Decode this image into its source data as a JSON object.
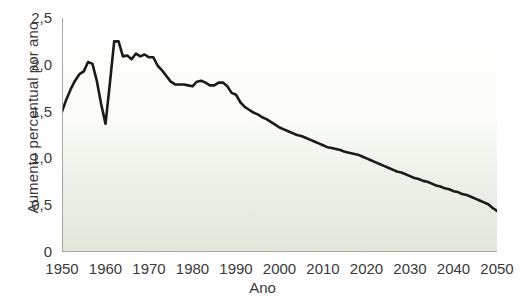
{
  "chart_data": {
    "type": "line",
    "title": "",
    "xlabel": "Ano",
    "ylabel": "Aumento percentual por ano",
    "xlim": [
      1950,
      2050
    ],
    "ylim": [
      0,
      2.5
    ],
    "grid": false,
    "legend": "none",
    "line_color": "#1a1a1a",
    "background_top_color": "#ffffff",
    "background_bottom_color": "#e1e6db",
    "axis_color": "#8f968c",
    "text_color": "#3a3a3a",
    "xticks": [
      1950,
      1960,
      1970,
      1980,
      1990,
      2000,
      2010,
      2020,
      2030,
      2040,
      2050
    ],
    "xtick_labels": [
      "1950",
      "1960",
      "1970",
      "1980",
      "1990",
      "2000",
      "2010",
      "2020",
      "2030",
      "2040",
      "2050"
    ],
    "yticks": [
      0,
      0.5,
      1.0,
      1.5,
      2.0,
      2.5
    ],
    "ytick_labels": [
      "0",
      "0,5",
      "1,0",
      "1,5",
      "2,0",
      "2,5"
    ],
    "series": [
      {
        "name": "Aumento percentual por ano",
        "x": [
          1950,
          1951,
          1952,
          1953,
          1954,
          1955,
          1956,
          1957,
          1958,
          1959,
          1960,
          1961,
          1962,
          1963,
          1964,
          1965,
          1966,
          1967,
          1968,
          1969,
          1970,
          1971,
          1972,
          1973,
          1974,
          1975,
          1976,
          1977,
          1978,
          1979,
          1980,
          1981,
          1982,
          1983,
          1984,
          1985,
          1986,
          1987,
          1988,
          1989,
          1990,
          1991,
          1992,
          1993,
          1994,
          1995,
          1996,
          1997,
          1998,
          1999,
          2000,
          2001,
          2002,
          2003,
          2004,
          2005,
          2006,
          2007,
          2008,
          2009,
          2010,
          2011,
          2012,
          2013,
          2014,
          2015,
          2016,
          2017,
          2018,
          2019,
          2020,
          2021,
          2022,
          2023,
          2024,
          2025,
          2026,
          2027,
          2028,
          2029,
          2030,
          2031,
          2032,
          2033,
          2034,
          2035,
          2036,
          2037,
          2038,
          2039,
          2040,
          2041,
          2042,
          2043,
          2044,
          2045,
          2046,
          2047,
          2048,
          2049,
          2050
        ],
        "y": [
          1.5,
          1.63,
          1.74,
          1.83,
          1.9,
          1.93,
          2.03,
          2.01,
          1.83,
          1.58,
          1.37,
          1.8,
          2.25,
          2.25,
          2.09,
          2.1,
          2.06,
          2.12,
          2.09,
          2.11,
          2.08,
          2.08,
          1.99,
          1.94,
          1.88,
          1.82,
          1.79,
          1.79,
          1.79,
          1.78,
          1.77,
          1.82,
          1.83,
          1.81,
          1.78,
          1.78,
          1.81,
          1.81,
          1.77,
          1.7,
          1.68,
          1.6,
          1.55,
          1.52,
          1.49,
          1.47,
          1.44,
          1.42,
          1.39,
          1.36,
          1.33,
          1.31,
          1.29,
          1.27,
          1.25,
          1.24,
          1.22,
          1.2,
          1.18,
          1.16,
          1.14,
          1.12,
          1.11,
          1.1,
          1.09,
          1.07,
          1.06,
          1.05,
          1.04,
          1.02,
          1.0,
          0.98,
          0.96,
          0.94,
          0.92,
          0.9,
          0.88,
          0.86,
          0.85,
          0.83,
          0.81,
          0.79,
          0.78,
          0.76,
          0.75,
          0.73,
          0.71,
          0.7,
          0.68,
          0.67,
          0.65,
          0.64,
          0.62,
          0.61,
          0.59,
          0.57,
          0.55,
          0.53,
          0.51,
          0.47,
          0.44
        ]
      }
    ],
    "annotations": [
      {
        "label": "pico de 1962",
        "x": 1962,
        "y": 2.25
      },
      {
        "label": "queda de 1960",
        "x": 1960,
        "y": 1.37
      }
    ]
  }
}
